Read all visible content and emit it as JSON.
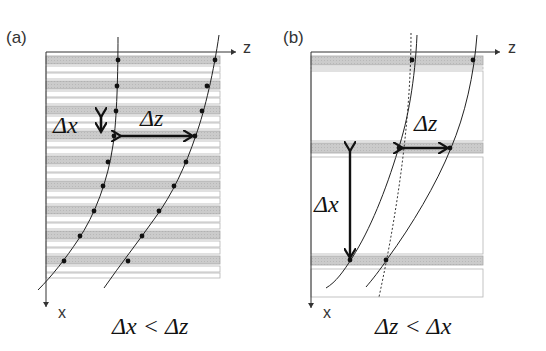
{
  "figure": {
    "type": "schematic diagram",
    "panels": [
      {
        "id": "a",
        "label": "(a)",
        "axis_z_label": "z",
        "axis_x_label": "x",
        "stripe_pattern": "narrow periodic layers: gray layer followed by two white layers, period ~25px",
        "gray_layer_count": 9,
        "delta_x_label": "Δx",
        "delta_z_label": "Δz",
        "relation": "Δx < Δz",
        "curves": 2,
        "dots_per_curve": 9
      },
      {
        "id": "b",
        "label": "(b)",
        "axis_z_label": "z",
        "axis_x_label": "x",
        "stripe_pattern": "wide layers: thin gray layers separated by wide white layers",
        "gray_layer_count": 3,
        "delta_x_label": "Δx",
        "delta_z_label": "Δz",
        "relation": "Δz < Δx",
        "curves": 2,
        "dots_per_curve": 3,
        "has_dotted_reference_line": true
      }
    ],
    "colors": {
      "gray_layer": "#c8c8c8",
      "white_layer": "#ffffff",
      "layer_border": "#b0b0b0",
      "line": "#222222"
    }
  }
}
